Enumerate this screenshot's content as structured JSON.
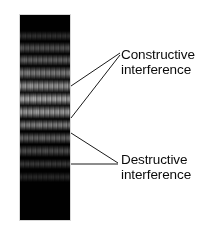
{
  "figure": {
    "background_color": "#ffffff"
  },
  "pattern": {
    "name": "interference-pattern",
    "description": "Vertical black screen showing horizontal interference fringes",
    "background_color": "#010101",
    "bright_band_color": "#b9b9b9",
    "x": 19,
    "y": 14,
    "width": 52,
    "height": 207,
    "bands": [
      {
        "center_y": 36,
        "thickness": 5,
        "brightness": 0.16,
        "type": "constructive"
      },
      {
        "center_y": 48,
        "thickness": 6,
        "brightness": 0.4,
        "type": "constructive"
      },
      {
        "center_y": 60,
        "thickness": 6,
        "brightness": 0.52,
        "type": "constructive"
      },
      {
        "center_y": 73,
        "thickness": 7,
        "brightness": 0.7,
        "type": "constructive"
      },
      {
        "center_y": 86,
        "thickness": 7,
        "brightness": 0.88,
        "type": "constructive"
      },
      {
        "center_y": 99,
        "thickness": 7,
        "brightness": 1.0,
        "type": "constructive"
      },
      {
        "center_y": 112,
        "thickness": 7,
        "brightness": 0.92,
        "type": "constructive"
      },
      {
        "center_y": 125,
        "thickness": 6,
        "brightness": 0.72,
        "type": "constructive"
      },
      {
        "center_y": 138,
        "thickness": 6,
        "brightness": 0.52,
        "type": "constructive"
      },
      {
        "center_y": 151,
        "thickness": 6,
        "brightness": 0.36,
        "type": "constructive"
      },
      {
        "center_y": 164,
        "thickness": 5,
        "brightness": 0.22,
        "type": "constructive"
      },
      {
        "center_y": 177,
        "thickness": 5,
        "brightness": 0.1,
        "type": "constructive"
      }
    ]
  },
  "annotations": [
    {
      "id": "constructive",
      "line1": "Constructive",
      "line2": "interference",
      "text_x": 121,
      "text_y": 47,
      "leaders": [
        {
          "from_x": 120,
          "from_y": 53,
          "to_x": 71,
          "to_y": 86
        },
        {
          "from_x": 120,
          "from_y": 55,
          "to_x": 71,
          "to_y": 118
        }
      ]
    },
    {
      "id": "destructive",
      "line1": "Destructive",
      "line2": "interference",
      "text_x": 121,
      "text_y": 152,
      "leaders": [
        {
          "from_x": 118,
          "from_y": 163,
          "to_x": 71,
          "to_y": 133
        },
        {
          "from_x": 118,
          "from_y": 164,
          "to_x": 71,
          "to_y": 164
        }
      ]
    }
  ],
  "styles": {
    "leader_color": "#1a1a1a",
    "leader_width": 1,
    "text_color": "#0b0b0b",
    "panel_border_color": "#d8d8d8"
  }
}
